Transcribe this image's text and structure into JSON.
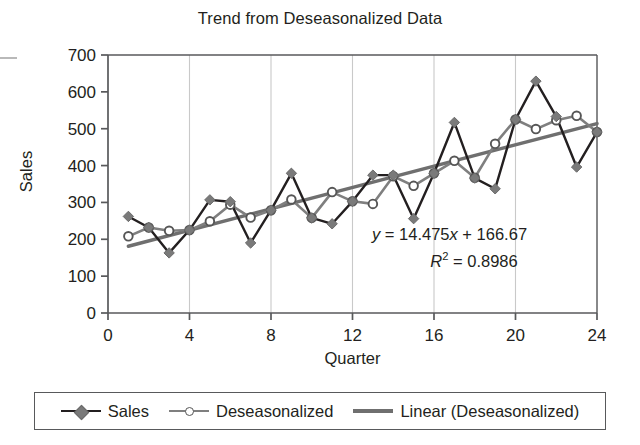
{
  "chart_data": {
    "type": "line",
    "title": "Trend from Deseasonalized Data",
    "xlabel": "Quarter",
    "ylabel": "Sales",
    "xlim": [
      0,
      24
    ],
    "ylim": [
      0,
      700
    ],
    "xticks": [
      0,
      4,
      8,
      12,
      16,
      20,
      24
    ],
    "yticks": [
      0,
      100,
      200,
      300,
      400,
      500,
      600,
      700
    ],
    "grid": "vertical",
    "legend_position": "bottom",
    "x": [
      1,
      2,
      3,
      4,
      5,
      6,
      7,
      8,
      9,
      10,
      11,
      12,
      13,
      14,
      15,
      16,
      17,
      18,
      19,
      20,
      21,
      22,
      23,
      24
    ],
    "series": [
      {
        "name": "Sales",
        "color": "#231f20",
        "marker": "diamond",
        "marker_color": "#7a7a7a",
        "values": [
          262,
          232,
          163,
          225,
          307,
          302,
          190,
          279,
          379,
          258,
          242,
          303,
          374,
          374,
          256,
          379,
          517,
          366,
          337,
          525,
          629,
          533,
          396,
          491
        ]
      },
      {
        "name": "Deseasonalized",
        "color": "#7f7f7f",
        "marker": "circle",
        "marker_color": "#ffffff",
        "values": [
          208,
          232,
          223,
          225,
          249,
          294,
          259,
          279,
          308,
          258,
          328,
          303,
          296,
          371,
          345,
          379,
          413,
          367,
          459,
          525,
          499,
          523,
          535,
          491
        ]
      },
      {
        "name": "Linear (Deseasonalized)",
        "color": "#6f6f6f",
        "marker": "none",
        "type": "trendline",
        "slope": 14.475,
        "intercept": 166.67,
        "values": [
          181.145,
          195.62,
          210.095,
          224.57,
          239.045,
          253.52,
          267.995,
          282.47,
          296.945,
          311.42,
          325.895,
          340.37,
          354.845,
          369.32,
          383.795,
          398.27,
          412.745,
          427.22,
          441.695,
          456.17,
          470.645,
          485.12,
          499.595,
          514.07
        ]
      }
    ],
    "annotations": {
      "equation": "y = 14.475x + 166.67",
      "equation_parts": {
        "lhs": "y",
        "eq": " = ",
        "slope": "14.475",
        "xvar": "x",
        "plus": " + ",
        "intercept": "166.67"
      },
      "r_squared_label": "R",
      "r_squared_exp": "2",
      "r_squared_value": " = 0.8986",
      "r_squared": "R² = 0.8986"
    }
  },
  "legend": {
    "items": [
      {
        "label": "Sales"
      },
      {
        "label": "Deseasonalized"
      },
      {
        "label": "Linear (Deseasonalized)"
      }
    ]
  },
  "axis": {
    "y_tick_labels": [
      "700",
      "600",
      "500",
      "400",
      "300",
      "200",
      "100",
      "0"
    ],
    "x_tick_labels": [
      "0",
      "4",
      "8",
      "12",
      "16",
      "20",
      "24"
    ]
  },
  "colors": {
    "sales_line": "#231f20",
    "deseasonalized_line": "#7f7f7f",
    "trend_line": "#6f6f6f",
    "axis": "#58595b",
    "gridline": "#c9c9c9",
    "text": "#231f20",
    "background": "#ffffff"
  }
}
